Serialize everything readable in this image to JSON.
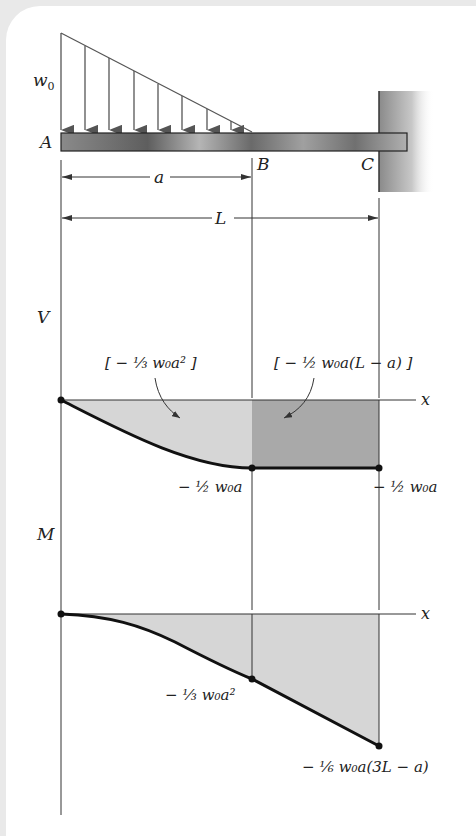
{
  "figure": {
    "beam": {
      "points": [
        "A",
        "B",
        "C"
      ],
      "load_label": "w",
      "load_subscript": "0",
      "dim_a": "a",
      "dim_L": "L"
    },
    "shear_diagram": {
      "axis_label": "V",
      "x_label": "x",
      "area1_label": "[ − ⅓ w₀a² ]",
      "area2_label": "[ − ½ w₀a(L − a) ]",
      "value_B": "− ½ w₀a",
      "value_C": "− ½ w₀a"
    },
    "moment_diagram": {
      "axis_label": "M",
      "x_label": "x",
      "value_B": "− ⅓ w₀a²",
      "value_C": "− ⅙ w₀a(3L − a)"
    }
  },
  "colors": {
    "line": "#333333",
    "fill_light": "#d4d4d4",
    "fill_dark": "#a9a9a9",
    "curve": "#111111"
  }
}
